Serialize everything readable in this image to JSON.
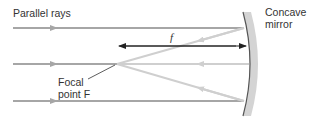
{
  "diagram": {
    "labels": {
      "parallel_rays": "Parallel rays",
      "mirror_line1": "Concave",
      "mirror_line2": "mirror",
      "focal_line1": "Focal",
      "focal_line2": "point F",
      "focal_length": "f"
    },
    "colors": {
      "incident_ray": "#a6a6a6",
      "reflected_ray": "#cfcfcf",
      "mirror_fill": "#d4d4d4",
      "mirror_edge": "#555555",
      "dimension_arrow": "#222222",
      "text": "#333333"
    },
    "rays": [
      {
        "name": "top",
        "y": 28
      },
      {
        "name": "middle",
        "y": 64
      },
      {
        "name": "bottom",
        "y": 101
      }
    ],
    "focal_point": {
      "x": 117,
      "y": 64
    }
  }
}
